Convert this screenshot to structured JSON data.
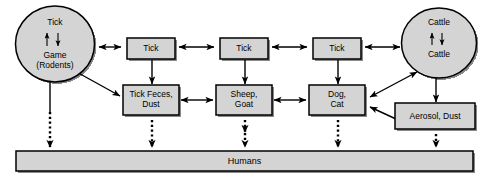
{
  "diagram": {
    "style": {
      "fill": "#d4d4d4",
      "stroke": "#000000",
      "shadow": "#8a8a8a",
      "background": "#ffffff",
      "text": "#000000"
    },
    "reservoirs": [
      {
        "id": "game-reservoir",
        "shape": "ellipse",
        "top_label": "Tick",
        "bottom_label": "Game\n(Rodents)",
        "cycle": "bidirectional"
      },
      {
        "id": "cattle-reservoir",
        "shape": "ellipse",
        "top_label": "Cattle",
        "bottom_label": "Cattle",
        "cycle": "bidirectional"
      }
    ],
    "boxes": [
      {
        "id": "tick-1",
        "label": "Tick"
      },
      {
        "id": "tick-2",
        "label": "Tick"
      },
      {
        "id": "tick-3",
        "label": "Tick"
      },
      {
        "id": "tick-feces-dust",
        "label": "Tick Feces,\nDust"
      },
      {
        "id": "sheep-goat",
        "label": "Sheep,\nGoat"
      },
      {
        "id": "dog-cat",
        "label": "Dog,\nCat"
      },
      {
        "id": "aerosol-dust",
        "label": "Aerosol, Dust"
      }
    ],
    "terminal_bar": {
      "id": "humans-bar",
      "label": "Humans"
    }
  }
}
